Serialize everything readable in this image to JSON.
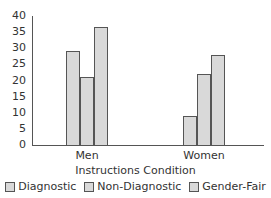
{
  "chart_data": {
    "type": "bar",
    "title": "",
    "xlabel": "Instructions Condition",
    "ylabel": "",
    "ylim": [
      0,
      40
    ],
    "yticks": [
      "0",
      "5",
      "10",
      "15",
      "20",
      "25",
      "30",
      "35",
      "40"
    ],
    "categories": [
      "Men",
      "Women"
    ],
    "series": [
      {
        "name": "Diagnostic",
        "values": [
          29,
          9
        ]
      },
      {
        "name": "Non-Diagnostic",
        "values": [
          21,
          22
        ]
      },
      {
        "name": "Gender-Fair",
        "values": [
          36.5,
          28
        ]
      }
    ],
    "grid": false,
    "legend_position": "bottom"
  },
  "colors": {
    "bar_fill": "#d9d9d9",
    "bar_stroke": "#555555"
  }
}
